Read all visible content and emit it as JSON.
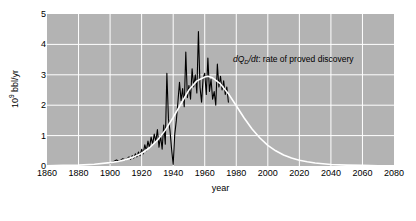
{
  "chart_data": {
    "type": "line",
    "title": "",
    "xlabel": "year",
    "ylabel": "10⁹ bbl/yr",
    "xlim": [
      1860,
      2080
    ],
    "ylim": [
      0,
      5
    ],
    "xticks": [
      1860,
      1880,
      1900,
      1920,
      1940,
      1960,
      1980,
      2000,
      2020,
      2040,
      2060,
      2080
    ],
    "yticks": [
      0,
      1,
      2,
      3,
      4,
      5
    ],
    "grid": true,
    "legend_position": "none",
    "plot_background_color": "#b3b3b3",
    "grid_color": "#ffffff",
    "annotations": [
      {
        "name": "discovery-rate-annotation",
        "math_prefix": "dQ",
        "math_subscript": "D",
        "math_suffix": "/dt",
        "text": ": rate of proved discovery",
        "x": 2000,
        "y": 3.6
      }
    ],
    "series": [
      {
        "name": "rate of proved discovery (data)",
        "color": "#000000",
        "width": 1.1,
        "points": [
          [
            1900,
            0.1
          ],
          [
            1902,
            0.14
          ],
          [
            1904,
            0.2
          ],
          [
            1906,
            0.16
          ],
          [
            1908,
            0.24
          ],
          [
            1910,
            0.2
          ],
          [
            1912,
            0.3
          ],
          [
            1913,
            0.22
          ],
          [
            1914,
            0.34
          ],
          [
            1915,
            0.26
          ],
          [
            1916,
            0.4
          ],
          [
            1917,
            0.3
          ],
          [
            1918,
            0.46
          ],
          [
            1919,
            0.34
          ],
          [
            1920,
            0.55
          ],
          [
            1921,
            0.4
          ],
          [
            1922,
            0.7
          ],
          [
            1923,
            0.5
          ],
          [
            1924,
            0.82
          ],
          [
            1925,
            0.6
          ],
          [
            1926,
            0.95
          ],
          [
            1927,
            0.72
          ],
          [
            1928,
            1.05
          ],
          [
            1929,
            0.8
          ],
          [
            1930,
            1.2
          ],
          [
            1931,
            0.62
          ],
          [
            1932,
            1.0
          ],
          [
            1933,
            0.55
          ],
          [
            1934,
            1.35
          ],
          [
            1935,
            0.72
          ],
          [
            1936,
            3.05
          ],
          [
            1937,
            1.55
          ],
          [
            1938,
            1.15
          ],
          [
            1939,
            0.55
          ],
          [
            1940,
            0.05
          ],
          [
            1941,
            1.05
          ],
          [
            1942,
            1.5
          ],
          [
            1943,
            2.1
          ],
          [
            1944,
            2.75
          ],
          [
            1945,
            2.15
          ],
          [
            1946,
            2.55
          ],
          [
            1947,
            1.95
          ],
          [
            1948,
            3.75
          ],
          [
            1949,
            2.25
          ],
          [
            1950,
            2.65
          ],
          [
            1951,
            2.2
          ],
          [
            1952,
            3.2
          ],
          [
            1953,
            2.6
          ],
          [
            1954,
            3.0
          ],
          [
            1955,
            2.4
          ],
          [
            1956,
            4.42
          ],
          [
            1957,
            2.6
          ],
          [
            1958,
            2.1
          ],
          [
            1959,
            2.9
          ],
          [
            1960,
            3.05
          ],
          [
            1961,
            2.35
          ],
          [
            1962,
            3.55
          ],
          [
            1963,
            2.45
          ],
          [
            1964,
            2.85
          ],
          [
            1965,
            2.2
          ],
          [
            1966,
            2.45
          ],
          [
            1967,
            2.0
          ],
          [
            1968,
            3.35
          ],
          [
            1969,
            2.6
          ],
          [
            1970,
            2.95
          ],
          [
            1971,
            2.5
          ],
          [
            1972,
            2.8
          ],
          [
            1973,
            2.35
          ],
          [
            1974,
            2.6
          ],
          [
            1975,
            2.1
          ]
        ]
      },
      {
        "name": "fitted logistic derivative curve",
        "color": "#ffffff",
        "width": 1.6,
        "points": [
          [
            1860,
            0.01
          ],
          [
            1870,
            0.02
          ],
          [
            1880,
            0.03
          ],
          [
            1890,
            0.06
          ],
          [
            1900,
            0.11
          ],
          [
            1905,
            0.15
          ],
          [
            1910,
            0.21
          ],
          [
            1915,
            0.3
          ],
          [
            1920,
            0.42
          ],
          [
            1925,
            0.6
          ],
          [
            1930,
            0.85
          ],
          [
            1935,
            1.18
          ],
          [
            1940,
            1.6
          ],
          [
            1945,
            2.05
          ],
          [
            1950,
            2.5
          ],
          [
            1955,
            2.8
          ],
          [
            1960,
            2.93
          ],
          [
            1962,
            2.95
          ],
          [
            1965,
            2.9
          ],
          [
            1970,
            2.7
          ],
          [
            1975,
            2.38
          ],
          [
            1980,
            1.98
          ],
          [
            1985,
            1.58
          ],
          [
            1990,
            1.22
          ],
          [
            1995,
            0.92
          ],
          [
            2000,
            0.68
          ],
          [
            2005,
            0.5
          ],
          [
            2010,
            0.36
          ],
          [
            2015,
            0.26
          ],
          [
            2020,
            0.19
          ],
          [
            2025,
            0.14
          ],
          [
            2030,
            0.1
          ],
          [
            2040,
            0.05
          ],
          [
            2050,
            0.03
          ],
          [
            2060,
            0.02
          ],
          [
            2070,
            0.01
          ],
          [
            2080,
            0.01
          ]
        ]
      }
    ]
  }
}
